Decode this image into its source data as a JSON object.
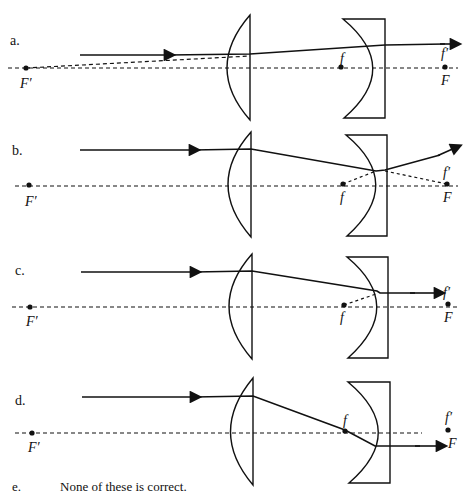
{
  "options": [
    {
      "letter": "a.",
      "labels": {
        "f": "f",
        "f_prime": "f′",
        "F": "F",
        "F_prime": "F′"
      }
    },
    {
      "letter": "b.",
      "labels": {
        "f": "f",
        "f_prime": "f′",
        "F": "F",
        "F_prime": "F′"
      }
    },
    {
      "letter": "c.",
      "labels": {
        "f": "f",
        "f_prime": "f′",
        "F": "F",
        "F_prime": "F′"
      }
    },
    {
      "letter": "d.",
      "labels": {
        "f": "f",
        "f_prime": "f′",
        "F": "F",
        "F_prime": "F′"
      }
    }
  ],
  "option_e": {
    "letter": "e.",
    "text": "None of these is correct."
  },
  "colors": {
    "ink": "#111111",
    "background": "#ffffff"
  }
}
